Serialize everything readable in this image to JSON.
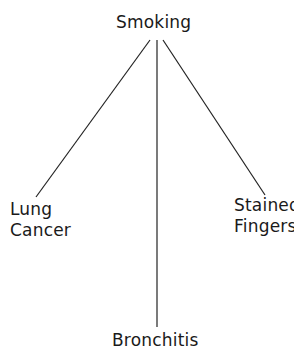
{
  "diagram": {
    "type": "tree",
    "root": {
      "id": "smoking",
      "label": "Smoking"
    },
    "children": [
      {
        "id": "lung_cancer",
        "label_lines": [
          "Lung",
          "Cancer"
        ]
      },
      {
        "id": "bronchitis",
        "label": "Bronchitis"
      },
      {
        "id": "stained_fingers",
        "label_lines": [
          "Stained",
          "Fingers"
        ]
      }
    ],
    "edges": [
      {
        "from": "smoking",
        "to": "lung_cancer"
      },
      {
        "from": "smoking",
        "to": "bronchitis"
      },
      {
        "from": "smoking",
        "to": "stained_fingers"
      }
    ],
    "line_color": "#222222"
  }
}
